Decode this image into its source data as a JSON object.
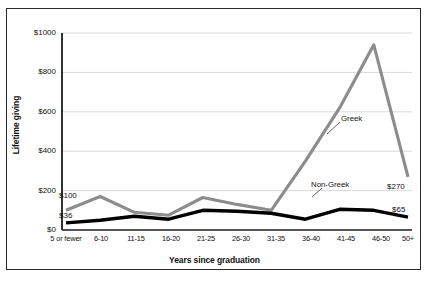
{
  "chart_data": {
    "type": "line",
    "title": "",
    "xlabel": "Years since graduation",
    "ylabel": "Lifetime giving",
    "categories": [
      "5 or fewer",
      "6-10",
      "11-15",
      "16-20",
      "21-25",
      "26-30",
      "31-35",
      "36-40",
      "41-45",
      "46-50",
      "50+"
    ],
    "series": [
      {
        "name": "Greek",
        "color": "#8c8c8c",
        "values": [
          100,
          170,
          90,
          75,
          165,
          130,
          100,
          350,
          620,
          940,
          270
        ]
      },
      {
        "name": "Non-Greek",
        "color": "#000000",
        "values": [
          36,
          50,
          70,
          55,
          100,
          95,
          85,
          55,
          105,
          100,
          65
        ]
      }
    ],
    "ylim": [
      0,
      1000
    ],
    "yticks": [
      "$0",
      "$200",
      "$400",
      "$600",
      "$800",
      "$1000"
    ],
    "ytick_values": [
      0,
      200,
      400,
      600,
      800,
      1000
    ],
    "grid": "horizontal",
    "legend": "inline-annotations",
    "annotations": [
      {
        "text": "Greek",
        "series": "Greek"
      },
      {
        "text": "Non-Greek",
        "series": "Non-Greek"
      }
    ],
    "point_labels": [
      {
        "text": "$100",
        "series": "Greek",
        "category": "5 or fewer"
      },
      {
        "text": "$36",
        "series": "Non-Greek",
        "category": "5 or fewer"
      },
      {
        "text": "$270",
        "series": "Greek",
        "category": "50+"
      },
      {
        "text": "$65",
        "series": "Non-Greek",
        "category": "50+"
      }
    ]
  },
  "axis": {
    "y_title": "Lifetime giving",
    "x_title": "Years since graduation",
    "y_ticks": [
      "$1000",
      "$800",
      "$600",
      "$400",
      "$200",
      "$0"
    ],
    "x_ticks": [
      "5 or fewer",
      "6-10",
      "11-15",
      "16-20",
      "21-25",
      "26-30",
      "31-35",
      "36-40",
      "41-45",
      "46-50",
      "50+"
    ]
  },
  "labels": {
    "greek": "Greek",
    "non_greek": "Non-Greek",
    "greek_start": "$100",
    "non_greek_start": "$36",
    "greek_end": "$270",
    "non_greek_end": "$65"
  },
  "colors": {
    "greek_line": "#8c8c8c",
    "non_greek_line": "#000000",
    "grid": "#cfcfcf",
    "axis": "#1a1a1a",
    "frame": "#2b2b2b"
  }
}
